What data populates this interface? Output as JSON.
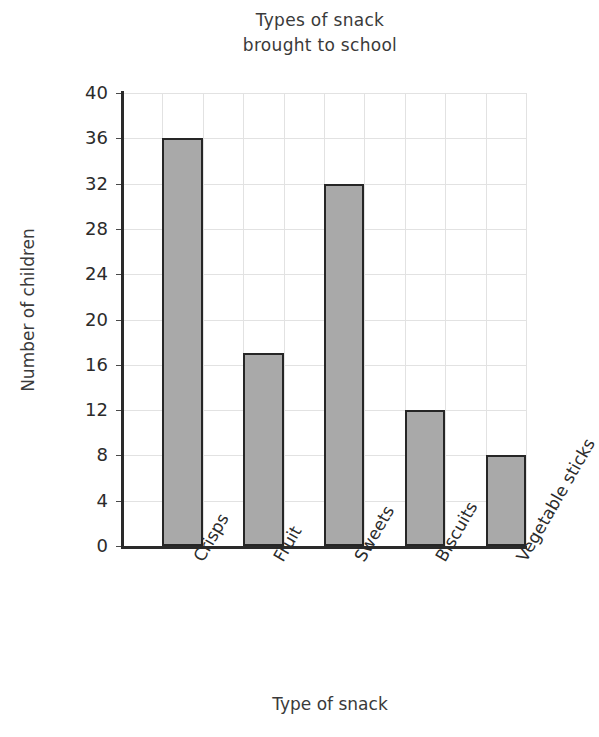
{
  "chart_data": {
    "type": "bar",
    "title_line1": "Types of snack",
    "title_line2": "brought to school",
    "xlabel": "Type of snack",
    "ylabel": "Number of children",
    "categories": [
      "Crisps",
      "Fruit",
      "Sweets",
      "Biscuits",
      "Vegetable sticks"
    ],
    "values": [
      36,
      17,
      32,
      12,
      8
    ],
    "ylim": [
      0,
      40
    ],
    "ytick_step": 4,
    "yticks": [
      0,
      4,
      8,
      12,
      16,
      20,
      24,
      28,
      32,
      36,
      40
    ],
    "ytick_labels": [
      "0",
      "4",
      "8",
      "12",
      "16",
      "20",
      "24",
      "28",
      "32",
      "36",
      "40"
    ],
    "grid": true,
    "grid_axis": "both",
    "legend": false,
    "legend_position": "none",
    "bar_fill_color": "#a9a9a9",
    "bar_edge_color": "#262626",
    "grid_color": "#e2e2e2",
    "axis_color": "#2a2a2a",
    "background_color": "#ffffff",
    "category_label_rotation": -60
  }
}
